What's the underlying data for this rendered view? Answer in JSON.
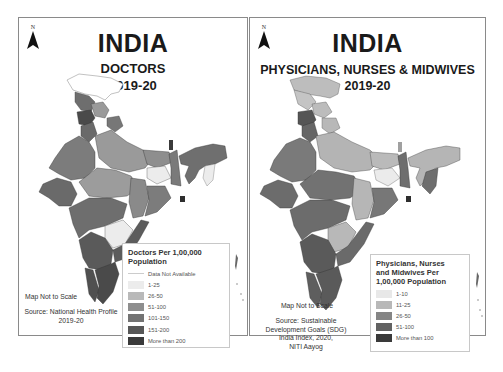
{
  "panels": [
    {
      "id": "doctors",
      "north_label": "N",
      "title": "INDIA",
      "subtitle_line1": "DOCTORS",
      "subtitle_line2": "2019-20",
      "scale_note": "Map Not to Scale",
      "source_line1": "Source: National Health Profile",
      "source_line2": "2019-20",
      "legend": {
        "title_line1": "Doctors Per 1,00,000",
        "title_line2": "Population",
        "items": [
          {
            "label": "Data Not Available",
            "color": "#ffffff"
          },
          {
            "label": "1-25",
            "color": "#ececec"
          },
          {
            "label": "26-50",
            "color": "#b9b9b9"
          },
          {
            "label": "51-100",
            "color": "#8e8e8e"
          },
          {
            "label": "101-150",
            "color": "#737373"
          },
          {
            "label": "151-200",
            "color": "#575757"
          },
          {
            "label": "More than 200",
            "color": "#3a3a3a"
          }
        ]
      }
    },
    {
      "id": "physicians-nurses-midwives",
      "north_label": "N",
      "title": "INDIA",
      "subtitle_line1": "PHYSICIANS, NURSES & MIDWIVES",
      "subtitle_line2": "2019-20",
      "scale_note": "Map Not to Scale",
      "source_line1": "Source: Sustainable",
      "source_line2": "Development Goals (SDG)",
      "source_line3": "India Index, 2020,",
      "source_line4": "NITI Aayog",
      "legend": {
        "title_line1": "Physicians, Nurses",
        "title_line2": "and Midwives Per",
        "title_line3": "1,00,000 Population",
        "items": [
          {
            "label": "1-10",
            "color": "#e8e8e8"
          },
          {
            "label": "11-25",
            "color": "#b8b8b8"
          },
          {
            "label": "26-50",
            "color": "#858585"
          },
          {
            "label": "51-100",
            "color": "#626262"
          },
          {
            "label": "More than 100",
            "color": "#3a3a3a"
          }
        ]
      }
    }
  ]
}
